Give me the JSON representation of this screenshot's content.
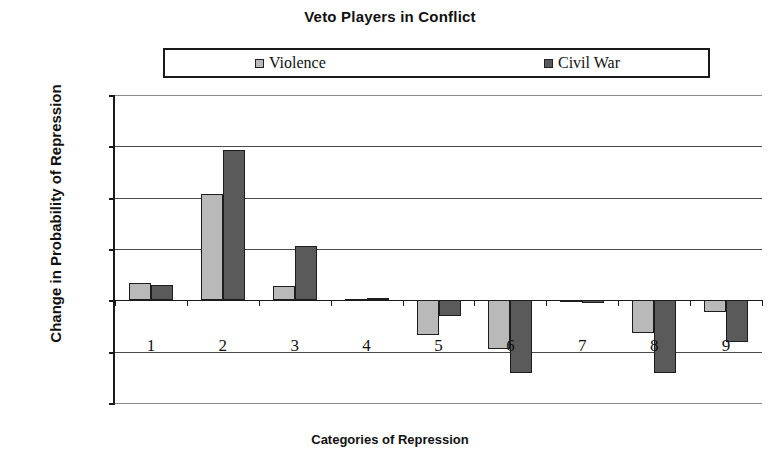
{
  "chart_data": {
    "type": "bar",
    "title": "Veto Players in Conflict",
    "xlabel": "Categories of Repression",
    "ylabel": "Change in Probability of Repression",
    "categories": [
      "1",
      "2",
      "3",
      "4",
      "5",
      "6",
      "7",
      "8",
      "9"
    ],
    "series": [
      {
        "name": "Violence",
        "color": "#b9b9b9",
        "legend_swatch": "violence-swatch-icon",
        "values": [
          0.017,
          0.104,
          0.014,
          0.001,
          -0.034,
          -0.047,
          -0.002,
          -0.032,
          -0.011
        ]
      },
      {
        "name": "Civil War",
        "color": "#5a5a5a",
        "legend_swatch": "civil-war-swatch-icon",
        "values": [
          0.015,
          0.1465,
          0.053,
          0.002,
          -0.015,
          -0.071,
          -0.003,
          -0.071,
          -0.041
        ]
      }
    ],
    "ylim": [
      -0.1,
      0.2
    ],
    "yticks": [
      0.2,
      0.15,
      0.1,
      0.05,
      0,
      -0.05,
      -0.1
    ],
    "ytick_labels": [
      "0.2",
      "0.15",
      "0.1",
      "0.05",
      "0",
      "-0.05",
      "-0.1"
    ],
    "grid": true,
    "legend_position": "top"
  }
}
